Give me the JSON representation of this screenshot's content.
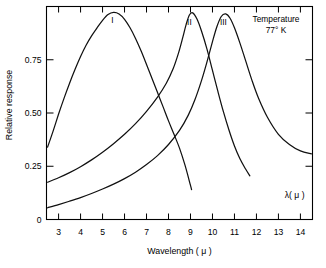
{
  "chart_data": {
    "type": "line",
    "title": "",
    "xlabel": "Wavelength  ( μ )",
    "ylabel": "Relative response",
    "xlim": [
      2.45,
      14.55
    ],
    "ylim": [
      0,
      1.0
    ],
    "grid": false,
    "legend_position": "inline-curve-labels",
    "x_ticks": [
      3,
      4,
      5,
      6,
      7,
      8,
      9,
      10,
      11,
      12,
      13,
      14
    ],
    "x_tick_labels": [
      "3",
      "4",
      "5",
      "6",
      "7",
      "8",
      "9",
      "10",
      "11",
      "12",
      "13",
      "14"
    ],
    "y_ticks": [
      0,
      0.25,
      0.5,
      0.75
    ],
    "y_tick_labels": [
      "0",
      "0.25",
      "0.50",
      "0.75"
    ],
    "axis_corner_label": "λ( μ )",
    "annotations": [
      {
        "name": "temperature-note-line1",
        "text": "Temperature"
      },
      {
        "name": "temperature-note-line2",
        "text": "77° K"
      }
    ],
    "series": [
      {
        "name": "I",
        "label": "I",
        "label_x": 5.45,
        "label_y": 0.935,
        "points": [
          [
            2.5,
            0.34
          ],
          [
            2.75,
            0.415
          ],
          [
            3.0,
            0.495
          ],
          [
            3.25,
            0.57
          ],
          [
            3.5,
            0.64
          ],
          [
            3.75,
            0.705
          ],
          [
            4.0,
            0.765
          ],
          [
            4.25,
            0.818
          ],
          [
            4.5,
            0.862
          ],
          [
            4.75,
            0.9
          ],
          [
            5.0,
            0.935
          ],
          [
            5.25,
            0.962
          ],
          [
            5.5,
            0.972
          ],
          [
            5.75,
            0.965
          ],
          [
            6.0,
            0.94
          ],
          [
            6.25,
            0.9
          ],
          [
            6.5,
            0.85
          ],
          [
            6.75,
            0.792
          ],
          [
            7.0,
            0.728
          ],
          [
            7.25,
            0.662
          ],
          [
            7.5,
            0.596
          ],
          [
            7.75,
            0.53
          ],
          [
            8.0,
            0.463
          ],
          [
            8.25,
            0.4
          ],
          [
            8.5,
            0.335
          ],
          [
            8.75,
            0.255
          ],
          [
            9.0,
            0.16
          ],
          [
            9.05,
            0.14
          ]
        ]
      },
      {
        "name": "II",
        "label": "II",
        "label_x": 8.95,
        "label_y": 0.925,
        "points": [
          [
            2.5,
            0.175
          ],
          [
            3.0,
            0.196
          ],
          [
            3.5,
            0.22
          ],
          [
            4.0,
            0.248
          ],
          [
            4.5,
            0.28
          ],
          [
            5.0,
            0.316
          ],
          [
            5.5,
            0.356
          ],
          [
            6.0,
            0.4
          ],
          [
            6.5,
            0.45
          ],
          [
            7.0,
            0.508
          ],
          [
            7.5,
            0.575
          ],
          [
            7.9,
            0.64
          ],
          [
            8.2,
            0.705
          ],
          [
            8.45,
            0.78
          ],
          [
            8.65,
            0.855
          ],
          [
            8.8,
            0.915
          ],
          [
            8.95,
            0.96
          ],
          [
            9.1,
            0.97
          ],
          [
            9.3,
            0.94
          ],
          [
            9.5,
            0.885
          ],
          [
            9.75,
            0.8
          ],
          [
            10.0,
            0.7
          ],
          [
            10.25,
            0.6
          ],
          [
            10.5,
            0.505
          ],
          [
            10.75,
            0.42
          ],
          [
            11.0,
            0.345
          ],
          [
            11.25,
            0.285
          ],
          [
            11.5,
            0.238
          ],
          [
            11.7,
            0.205
          ]
        ]
      },
      {
        "name": "III",
        "label": "III",
        "label_x": 10.5,
        "label_y": 0.925,
        "points": [
          [
            2.5,
            0.055
          ],
          [
            3.0,
            0.07
          ],
          [
            3.5,
            0.086
          ],
          [
            4.0,
            0.103
          ],
          [
            4.5,
            0.122
          ],
          [
            5.0,
            0.143
          ],
          [
            5.5,
            0.166
          ],
          [
            6.0,
            0.192
          ],
          [
            6.5,
            0.222
          ],
          [
            7.0,
            0.258
          ],
          [
            7.5,
            0.3
          ],
          [
            8.0,
            0.352
          ],
          [
            8.5,
            0.418
          ],
          [
            8.9,
            0.49
          ],
          [
            9.2,
            0.562
          ],
          [
            9.5,
            0.652
          ],
          [
            9.75,
            0.74
          ],
          [
            10.0,
            0.835
          ],
          [
            10.2,
            0.905
          ],
          [
            10.4,
            0.953
          ],
          [
            10.6,
            0.965
          ],
          [
            10.8,
            0.945
          ],
          [
            11.0,
            0.9
          ],
          [
            11.25,
            0.828
          ],
          [
            11.5,
            0.748
          ],
          [
            11.8,
            0.652
          ],
          [
            12.1,
            0.568
          ],
          [
            12.5,
            0.48
          ],
          [
            13.0,
            0.4
          ],
          [
            13.5,
            0.352
          ],
          [
            14.0,
            0.322
          ],
          [
            14.5,
            0.308
          ]
        ]
      }
    ]
  }
}
